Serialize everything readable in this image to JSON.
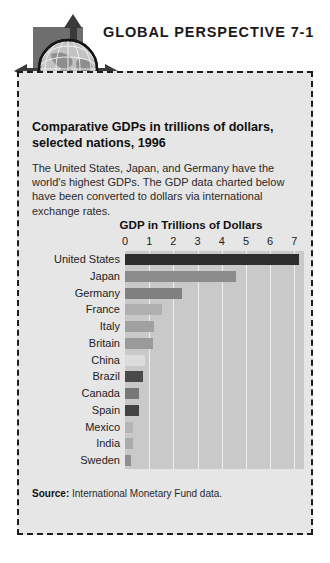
{
  "header": {
    "title": "GLOBAL PERSPECTIVE 7-1",
    "globe_icon": "globe-icon",
    "arrow_up_icon": "arrow-up-icon",
    "arrow_left_icon": "arrow-left-icon",
    "arrow_right_icon": "arrow-right-icon"
  },
  "panel": {
    "heading": "Comparative GDPs in trillions of dollars, selected nations, 1996",
    "body": "The United States, Japan, and Germany have the world's highest GDPs. The GDP data charted below have been converted to dollars via international exchange rates.",
    "source_label": "Source:",
    "source_text": "International Monetary Fund data."
  },
  "colors": {
    "panel_background": "#e6e6e6",
    "plot_background": "#c9c9c9",
    "gridline": "#eeeeee",
    "border": "#1d1d1d",
    "square": "#6e6e6e",
    "arrow": "#3a3a3a"
  },
  "chart_data": {
    "type": "bar",
    "orientation": "horizontal",
    "title": "GDP in Trillions of Dollars",
    "xlabel": "GDP in Trillions of Dollars",
    "ylabel": "",
    "xlim": [
      0,
      7.4
    ],
    "xticks": [
      0,
      1,
      2,
      3,
      4,
      5,
      6,
      7
    ],
    "grid": true,
    "legend": "none",
    "categories": [
      "United States",
      "Japan",
      "Germany",
      "France",
      "Italy",
      "Britain",
      "China",
      "Brazil",
      "Canada",
      "Spain",
      "Mexico",
      "India",
      "Sweden"
    ],
    "values": [
      7.2,
      4.6,
      2.35,
      1.55,
      1.2,
      1.15,
      0.82,
      0.75,
      0.58,
      0.58,
      0.33,
      0.33,
      0.25
    ],
    "bar_colors": [
      "#2d2d2d",
      "#8c8c8c",
      "#808080",
      "#b0b0b0",
      "#a0a0a0",
      "#9a9a9a",
      "#dcdcdc",
      "#4a4a4a",
      "#777777",
      "#444444",
      "#b5b5b5",
      "#aaaaaa",
      "#8f8f8f"
    ]
  }
}
